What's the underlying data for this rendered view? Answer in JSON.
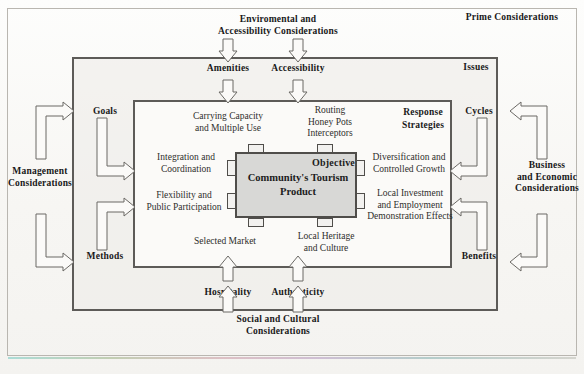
{
  "diagram": {
    "title_context": "Community Tourism Product Framework",
    "outer_layer": {
      "name": "Prime Considerations",
      "corner_label": "Prime Considerations",
      "top_label": "Enviromental and\nAccessibility Considerations",
      "bottom_label": "Social and Cultural\nConsiderations",
      "left_label": "Management\nConsiderations",
      "right_label": "Business\nand Economic\nConsiderations"
    },
    "middle_layer": {
      "corner_label": "Issues",
      "top_labels": [
        "Amenities",
        "Accessibility"
      ],
      "bottom_labels": [
        "Hospitality",
        "Authenticity"
      ],
      "left_labels": [
        "Goals",
        "Methods"
      ],
      "right_labels": [
        "Cycles",
        "Benefits"
      ]
    },
    "inner_layer": {
      "corner_label": "Response\nStrategies",
      "top_labels": [
        "Carrying Capacity\nand Multiple Use",
        "Routing\nHoney Pots\nInterceptors"
      ],
      "left_labels": [
        "Integration and\nCoordination",
        "Flexibility and\nPublic Participation"
      ],
      "right_labels": [
        "Diversification and\nControlled Growth",
        "Local Investment\nand Employment\nDemonstration Effects"
      ],
      "bottom_labels": [
        "Selected Market",
        "Local Heritage\nand Culture"
      ]
    },
    "core": {
      "objective_label": "Objective",
      "title": "Community's\nTourism\nProduct"
    },
    "colors": {
      "core_fill": "#d8d8d6",
      "frame_stroke": "#5d5b58",
      "outer_stroke": "#b9b6b0",
      "arrow_stroke": "#6b6965",
      "text": "#3a3a38",
      "page_background": "#fbfaf8"
    }
  }
}
